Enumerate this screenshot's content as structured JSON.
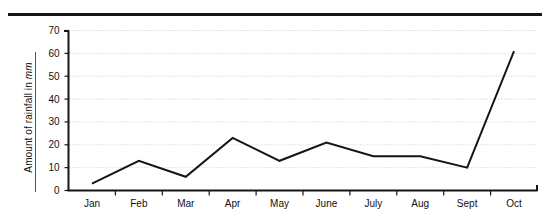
{
  "figure": {
    "top_rule": "horizontal-rule",
    "axis_color": "#151515",
    "grid_color": "#c9c9c9",
    "line_color": "#151515",
    "background": "#ffffff"
  },
  "axes": {
    "y_title_prefix": "Amount of rainfall in ",
    "y_title_unit": "mm",
    "y_ticks": [
      "0",
      "10",
      "20",
      "30",
      "40",
      "50",
      "60",
      "70"
    ],
    "x_ticks": [
      "Jan",
      "Feb",
      "Mar",
      "Apr",
      "May",
      "June",
      "July",
      "Aug",
      "Sept",
      "Oct"
    ]
  },
  "chart_data": {
    "type": "line",
    "title": "",
    "xlabel": "",
    "ylabel": "Amount of rainfall in mm",
    "categories": [
      "Jan",
      "Feb",
      "Mar",
      "Apr",
      "May",
      "June",
      "July",
      "Aug",
      "Sept",
      "Oct"
    ],
    "values": [
      3,
      13,
      6,
      23,
      13,
      21,
      15,
      15,
      10,
      61
    ],
    "ylim": [
      0,
      70
    ],
    "ytick_step": 10,
    "grid": "horizontal-dotted",
    "legend": "none",
    "series": [
      {
        "name": "Rainfall",
        "values": [
          3,
          13,
          6,
          23,
          13,
          21,
          15,
          15,
          10,
          61
        ]
      }
    ]
  }
}
